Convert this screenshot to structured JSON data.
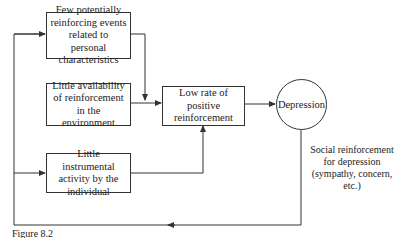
{
  "diagram": {
    "nodes": {
      "few_events": "Few potentially reinforcing events related to personal characteristics",
      "little_availability": "Little availability of reinforcement in the environment",
      "little_activity": "Little instrumental activity by the individual",
      "low_rate": "Low rate of positive reinforcement",
      "depression": "Depression"
    },
    "feedback_label": "Social reinforcement for depression (sympathy, concern, etc.)",
    "caption": "Figure 8.2",
    "edges": [
      {
        "from": "few_events",
        "to": "low_rate"
      },
      {
        "from": "little_availability",
        "to": "low_rate"
      },
      {
        "from": "little_activity",
        "to": "low_rate"
      },
      {
        "from": "low_rate",
        "to": "depression"
      },
      {
        "from": "depression",
        "to": "few_events",
        "label": "feedback"
      },
      {
        "from": "depression",
        "to": "little_activity",
        "label": "feedback"
      }
    ]
  }
}
